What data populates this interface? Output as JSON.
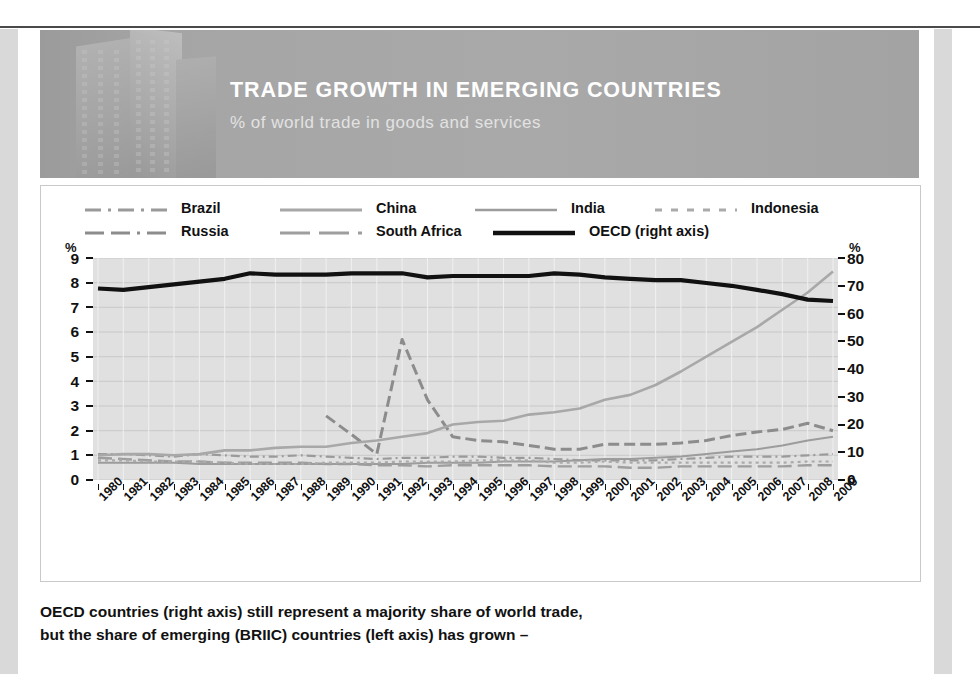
{
  "banner": {
    "title": "TRADE GROWTH IN EMERGING COUNTRIES",
    "subtitle": "% of world trade in goods and services"
  },
  "caption": {
    "line1": "OECD countries (right axis) still represent a majority share of world trade,",
    "line2": "but the share of emerging (BRIIC) countries (left axis) has grown –"
  },
  "axes": {
    "left_unit": "%",
    "right_unit": "%",
    "left_ticks": [
      "9",
      "8",
      "7",
      "6",
      "5",
      "4",
      "3",
      "2",
      "1",
      "0"
    ],
    "right_ticks": [
      "80",
      "70",
      "60",
      "50",
      "40",
      "30",
      "20",
      "10",
      "0"
    ]
  },
  "chart_data": {
    "type": "line",
    "title": "TRADE GROWTH IN EMERGING COUNTRIES",
    "subtitle": "% of world trade in goods and services",
    "xlabel": "",
    "ylabel": "%",
    "y2label": "%",
    "ylim": [
      0,
      9
    ],
    "y2lim": [
      0,
      80
    ],
    "grid": true,
    "legend_position": "top",
    "x": [
      "1980",
      "1981",
      "1982",
      "1983",
      "1984",
      "1985",
      "1986",
      "1987",
      "1988",
      "1989",
      "1990",
      "1991",
      "1992",
      "1993",
      "1994",
      "1995",
      "1996",
      "1997",
      "1998",
      "1999",
      "2000",
      "2001",
      "2002",
      "2003",
      "2004",
      "2005",
      "2006",
      "2007",
      "2008",
      "2009"
    ],
    "series": [
      {
        "name": "Brazil",
        "axis": "left",
        "color": "#9a9a9a",
        "style": "dashdot",
        "values": [
          1.05,
          1.05,
          1.0,
          0.95,
          1.05,
          1.0,
          0.95,
          0.95,
          1.0,
          0.95,
          0.9,
          0.85,
          0.9,
          0.9,
          0.95,
          0.95,
          0.9,
          0.9,
          0.85,
          0.8,
          0.8,
          0.8,
          0.8,
          0.85,
          0.9,
          0.95,
          0.95,
          0.95,
          1.0,
          1.05
        ]
      },
      {
        "name": "Russia",
        "axis": "left",
        "color": "#8c8c8c",
        "style": "dashed",
        "values": [
          null,
          null,
          null,
          null,
          null,
          null,
          null,
          null,
          null,
          2.6,
          1.85,
          1.05,
          5.7,
          3.25,
          1.75,
          1.6,
          1.55,
          1.4,
          1.25,
          1.25,
          1.45,
          1.45,
          1.45,
          1.5,
          1.6,
          1.8,
          1.95,
          2.05,
          2.3,
          2.0
        ]
      },
      {
        "name": "China",
        "axis": "left",
        "color": "#a8a8a8",
        "style": "solid",
        "values": [
          1.0,
          1.05,
          1.05,
          1.0,
          1.05,
          1.2,
          1.2,
          1.3,
          1.35,
          1.35,
          1.5,
          1.6,
          1.75,
          1.9,
          2.25,
          2.35,
          2.4,
          2.65,
          2.75,
          2.9,
          3.25,
          3.45,
          3.85,
          4.4,
          5.0,
          5.6,
          6.2,
          6.9,
          7.6,
          8.45
        ]
      },
      {
        "name": "South Africa",
        "axis": "left",
        "color": "#9e9e9e",
        "style": "longdash",
        "values": [
          0.9,
          0.85,
          0.8,
          0.75,
          0.75,
          0.7,
          0.7,
          0.7,
          0.7,
          0.65,
          0.65,
          0.6,
          0.6,
          0.55,
          0.6,
          0.6,
          0.6,
          0.6,
          0.55,
          0.55,
          0.55,
          0.5,
          0.5,
          0.55,
          0.55,
          0.55,
          0.55,
          0.55,
          0.6,
          0.6
        ]
      },
      {
        "name": "India",
        "axis": "left",
        "color": "#9c9c9c",
        "style": "solid-thin",
        "values": [
          0.7,
          0.7,
          0.7,
          0.7,
          0.65,
          0.65,
          0.65,
          0.65,
          0.65,
          0.65,
          0.65,
          0.65,
          0.65,
          0.7,
          0.7,
          0.7,
          0.75,
          0.75,
          0.75,
          0.8,
          0.85,
          0.85,
          0.9,
          0.95,
          1.05,
          1.15,
          1.25,
          1.4,
          1.6,
          1.75
        ]
      },
      {
        "name": "Indonesia",
        "axis": "left",
        "color": "#aaaaaa",
        "style": "dotted",
        "values": [
          0.8,
          0.8,
          0.75,
          0.75,
          0.75,
          0.7,
          0.65,
          0.65,
          0.65,
          0.7,
          0.7,
          0.7,
          0.75,
          0.75,
          0.75,
          0.8,
          0.8,
          0.8,
          0.7,
          0.7,
          0.75,
          0.7,
          0.7,
          0.7,
          0.7,
          0.7,
          0.7,
          0.7,
          0.75,
          0.75
        ]
      },
      {
        "name": "OECD (right axis)",
        "axis": "right",
        "color": "#111111",
        "style": "thick",
        "values": [
          69.0,
          68.5,
          69.5,
          70.5,
          71.5,
          72.5,
          74.5,
          74.0,
          74.0,
          74.0,
          74.5,
          74.5,
          74.5,
          73.0,
          73.5,
          73.5,
          73.5,
          73.5,
          74.5,
          74.0,
          73.0,
          72.5,
          72.0,
          72.0,
          71.0,
          70.0,
          68.5,
          67.0,
          65.0,
          64.5
        ]
      }
    ]
  },
  "legend": {
    "items": [
      {
        "label": "Brazil",
        "style": "dashdot",
        "color": "#9a9a9a"
      },
      {
        "label": "China",
        "style": "solid",
        "color": "#a8a8a8"
      },
      {
        "label": "India",
        "style": "solid-thin",
        "color": "#9c9c9c"
      },
      {
        "label": "Indonesia",
        "style": "dotted",
        "color": "#aaaaaa"
      },
      {
        "label": "Russia",
        "style": "dashed",
        "color": "#8c8c8c"
      },
      {
        "label": "South Africa",
        "style": "longdash",
        "color": "#9e9e9e"
      },
      {
        "label": "OECD (right axis)",
        "style": "thick",
        "color": "#111111"
      }
    ]
  }
}
